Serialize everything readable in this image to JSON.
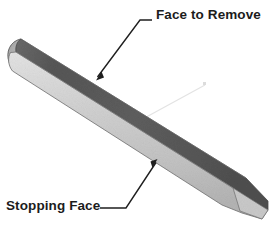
{
  "figure": {
    "background_color": "#ffffff",
    "width": 272,
    "height": 226
  },
  "callouts": [
    {
      "id": "face-to-remove",
      "label": "Face to Remove",
      "text_position": {
        "x": 156,
        "y": 8
      },
      "leader": {
        "horizontal_start": {
          "x": 152,
          "y": 20
        },
        "elbow": {
          "x": 140,
          "y": 20
        },
        "arrow_tip": {
          "x": 96,
          "y": 79
        }
      },
      "color": "#1c1c1c"
    },
    {
      "id": "stopping-face",
      "label": "Stopping Face",
      "text_position": {
        "x": 6,
        "y": 199
      },
      "leader": {
        "horizontal_start": {
          "x": 100,
          "y": 208
        },
        "elbow": {
          "x": 126,
          "y": 208
        },
        "arrow_tip": {
          "x": 157,
          "y": 160
        }
      },
      "color": "#1c1c1c"
    }
  ],
  "object": {
    "name": "tapered-bar",
    "description": "Elongated rectangular bar in isometric view sloping down to the right, with a rounded left end and a chamfered pointed right end.",
    "faces": [
      {
        "name": "top-face",
        "role": "Face to Remove",
        "color": "#5b5b5b",
        "shade": "dark"
      },
      {
        "name": "front-face",
        "role": "Stopping Face",
        "color": "#cfcfcf",
        "shade": "light"
      },
      {
        "name": "left-end-cap",
        "color": "#b9b9b9",
        "shade": "medium"
      }
    ],
    "slope_degrees": 26,
    "faint_construction_line": {
      "name": "faint-leader-line",
      "color": "#e2e2e2",
      "from": {
        "x": 128,
        "y": 126
      },
      "to": {
        "x": 206,
        "y": 84
      }
    }
  },
  "colors": {
    "background": "#ffffff",
    "dark_face": "#5b5b5b",
    "light_face": "#cfcfcf",
    "outline": "#3a3a3a",
    "text": "#1c1c1c",
    "faint_line": "#e2e2e2"
  }
}
